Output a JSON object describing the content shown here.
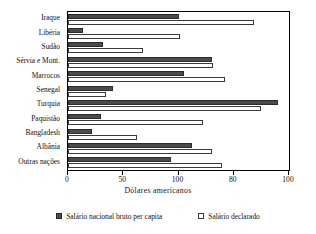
{
  "chart_data": {
    "type": "bar",
    "orientation": "horizontal",
    "title": "",
    "xlabel": "Dólares americanos",
    "ylabel": "",
    "xlim": [
      0,
      200
    ],
    "grid": false,
    "legend_position": "bottom",
    "categories": [
      "Iraque",
      "Libéria",
      "Sudão",
      "Sérvia e Mont.",
      "Marrocos",
      "Senegal",
      "Turquia",
      "Paquistão",
      "Bangladesh",
      "Albânia",
      "Outras nações"
    ],
    "tick_labels": [
      "0",
      "50",
      "100",
      "80",
      "100"
    ],
    "tick_values": [
      0,
      50,
      100,
      150,
      200
    ],
    "series": [
      {
        "name": "Salário nacional bruto per capita",
        "color": "#4a4a4a",
        "values": [
          100,
          14,
          32,
          130,
          105,
          41,
          190,
          30,
          22,
          112,
          93
        ]
      },
      {
        "name": "Salário declarado",
        "color": "#ffffff",
        "values": [
          168,
          101,
          68,
          131,
          142,
          34,
          175,
          122,
          62,
          130,
          139
        ]
      }
    ]
  },
  "legend": {
    "entries": [
      {
        "label": "Salário nacional bruto per capita",
        "swatch": "filled-dark-square"
      },
      {
        "label": "Salário declarado",
        "swatch": "open-white-square"
      }
    ]
  },
  "axis": {
    "x_title": "Dólares americanos"
  },
  "colors": {
    "series_gni": "#4a4a4a",
    "series_declared": "#ffffff",
    "axis": "#000000",
    "background": "#ffffff",
    "text": "#111111"
  }
}
